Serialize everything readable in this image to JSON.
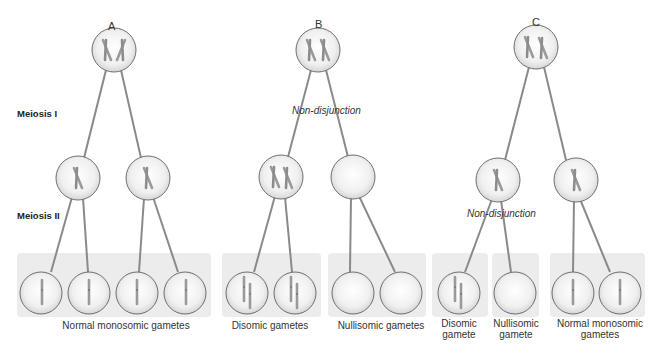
{
  "stages": {
    "meiosis_1": "Meiosis I",
    "meiosis_2": "Meiosis II"
  },
  "columns": [
    {
      "letter": "A",
      "non_disjunction_label": null,
      "gamete_labels": [
        "Normal monosomic gametes"
      ]
    },
    {
      "letter": "B",
      "non_disjunction_label": "Non-disjunction",
      "gamete_labels": [
        "Disomic gametes",
        "Nullisomic gametes"
      ]
    },
    {
      "letter": "C",
      "non_disjunction_label": "Non-disjunction",
      "gamete_labels": [
        "Disomic gamete",
        "Nullisomic gamete",
        "Normal monosomic gametes"
      ]
    }
  ],
  "labels": {
    "a_letter": "A",
    "b_letter": "B",
    "c_letter": "C",
    "b_nondisjunction": "Non-disjunction",
    "c_nondisjunction": "Non-disjunction",
    "a_gametes": "Normal monosomic gametes",
    "b_disomic": "Disomic gametes",
    "b_nullisomic": "Nullisomic gametes",
    "c_disomic_1": "Disomic",
    "c_disomic_2": "gamete",
    "c_nullisomic_1": "Nullisomic",
    "c_nullisomic_2": "gamete",
    "c_normal_1": "Normal monosomic",
    "c_normal_2": "gametes"
  },
  "colors": {
    "line": "#8a8a8a",
    "cell_outline": "#6f6f6f",
    "cell_fill_center": "#ffffff",
    "cell_fill_edge": "#d9d9d9",
    "chromosome": "#9a9a9a",
    "panel": "#ececec"
  }
}
